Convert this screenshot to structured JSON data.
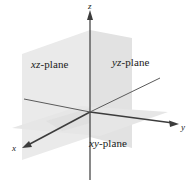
{
  "figure": {
    "width": 194,
    "height": 180,
    "background_color": "#ffffff",
    "axis_color": "#3c3c3c",
    "plane_fill_color": "#e4e4e4",
    "plane_fill_color_light": "#ececec",
    "text_color": "#1a1a1a"
  },
  "axes": [
    {
      "name": "x",
      "label": "x",
      "direction": "lower-left",
      "arrowhead": true
    },
    {
      "name": "y",
      "label": "y",
      "direction": "right",
      "arrowhead": true
    },
    {
      "name": "z",
      "label": "z",
      "direction": "up",
      "arrowhead": true
    }
  ],
  "planes": [
    {
      "name": "xz-plane",
      "label_prefix": "xz",
      "label_suffix": "-plane"
    },
    {
      "name": "yz-plane",
      "label_prefix": "yz",
      "label_suffix": "-plane"
    },
    {
      "name": "xy-plane",
      "label_prefix": "xy",
      "label_suffix": "-plane"
    }
  ],
  "labels": {
    "xz_plane_italic": "xz",
    "xz_plane_rest": "-plane",
    "yz_plane_italic": "yz",
    "yz_plane_rest": "-plane",
    "xy_plane_italic": "xy",
    "xy_plane_rest": "-plane",
    "x_axis": "x",
    "y_axis": "y",
    "z_axis": "z"
  },
  "origin": {
    "x": 90,
    "y": 112
  }
}
